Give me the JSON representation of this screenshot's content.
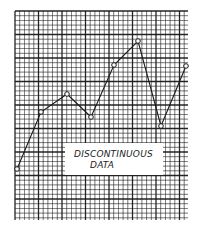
{
  "chart_data": {
    "type": "line",
    "title": "",
    "xlabel": "",
    "ylabel": "",
    "grid": true,
    "annotation": [
      "DISCONTINUOUS",
      "DATA"
    ],
    "x": [
      1,
      2,
      3,
      4,
      5,
      6,
      7,
      8
    ],
    "values": [
      11,
      23,
      27,
      22,
      33,
      38,
      20,
      33
    ],
    "ylim": [
      0,
      44
    ],
    "point_pixels": [
      [
        17,
        169
      ],
      [
        41,
        112
      ],
      [
        67,
        94
      ],
      [
        91,
        117
      ],
      [
        114,
        65
      ],
      [
        138,
        41
      ],
      [
        161,
        126
      ],
      [
        186,
        66
      ]
    ]
  },
  "grid": {
    "left": 15,
    "top": 11,
    "right": 188,
    "bottom": 220,
    "cell": 4.7,
    "major_every": 5,
    "line_color": "#1a1a1a"
  },
  "label": {
    "line1": "DISCONTINUOUS",
    "line2": "DATA"
  }
}
